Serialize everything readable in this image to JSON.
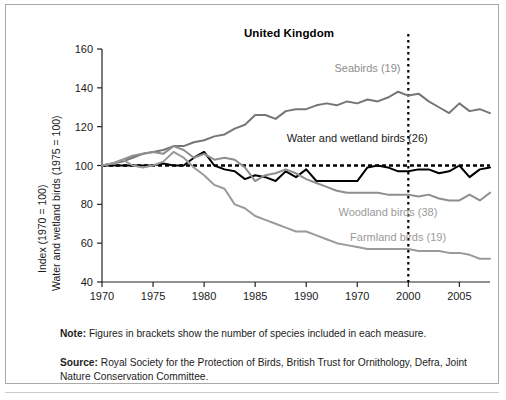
{
  "chart_data": {
    "type": "line",
    "title": "United Kingdom",
    "xlabel": "",
    "ylabel": "Index (1970 = 100)",
    "ylabel2": "Water and wetland birds (1975 = 100)",
    "xlim": [
      1970,
      2008
    ],
    "ylim": [
      40,
      160
    ],
    "yticks": [
      40,
      60,
      80,
      100,
      120,
      140,
      160
    ],
    "xticks": [
      1970,
      1975,
      1980,
      1985,
      1990,
      1970,
      2000,
      2005
    ],
    "xtick_positions": [
      1970,
      1975,
      1980,
      1985,
      1990,
      1995,
      2000,
      2005
    ],
    "grid": false,
    "legend_position": "inline-annotations",
    "baseline": {
      "value": 100,
      "style": "dotted",
      "color": "#000000"
    },
    "marker_line": {
      "value": 2000,
      "style": "dotted",
      "color": "#000000",
      "label": "United Kingdom"
    },
    "x": [
      1970,
      1971,
      1972,
      1973,
      1974,
      1975,
      1976,
      1977,
      1978,
      1979,
      1980,
      1981,
      1982,
      1983,
      1984,
      1985,
      1986,
      1987,
      1988,
      1989,
      1990,
      1991,
      1992,
      1993,
      1994,
      1995,
      1996,
      1997,
      1998,
      1999,
      2000,
      2001,
      2002,
      2003,
      2004,
      2005,
      2006,
      2007,
      2008
    ],
    "series": [
      {
        "name": "Seabirds",
        "species": 19,
        "label": "Seabirds (19)",
        "color": "#767676",
        "width": 2.0,
        "values": [
          100,
          101,
          102,
          104,
          106,
          107,
          108,
          110,
          110,
          112,
          113,
          115,
          116,
          119,
          121,
          126,
          126,
          124,
          128,
          129,
          129,
          131,
          132,
          131,
          133,
          132,
          134,
          133,
          135,
          138,
          136,
          137,
          133,
          130,
          127,
          132,
          128,
          129,
          127
        ]
      },
      {
        "name": "Water and wetland birds",
        "species": 26,
        "label": "Water and wetland birds (26)",
        "color": "#000000",
        "width": 2.0,
        "values": [
          100,
          100,
          100,
          100,
          100,
          100,
          101,
          100,
          100,
          104,
          107,
          100,
          98,
          97,
          93,
          95,
          94,
          92,
          97,
          94,
          98,
          92,
          92,
          92,
          92,
          92,
          99,
          100,
          99,
          97,
          97,
          98,
          98,
          96,
          97,
          100,
          94,
          98,
          99
        ]
      },
      {
        "name": "Woodland birds",
        "species": 38,
        "label": "Woodland birds (38)",
        "color": "#8e8e8e",
        "width": 2.0,
        "values": [
          100,
          101,
          103,
          105,
          106,
          107,
          106,
          110,
          108,
          104,
          106,
          103,
          104,
          103,
          99,
          92,
          95,
          96,
          98,
          96,
          93,
          91,
          89,
          87,
          86,
          86,
          86,
          86,
          85,
          85,
          85,
          84,
          85,
          83,
          82,
          82,
          85,
          82,
          86
        ]
      },
      {
        "name": "Farmland birds",
        "species": 19,
        "label": "Farmland birds (19)",
        "color": "#9a9a9a",
        "width": 2.0,
        "values": [
          100,
          101,
          103,
          100,
          99,
          100,
          102,
          107,
          104,
          99,
          95,
          90,
          88,
          80,
          78,
          74,
          72,
          70,
          68,
          66,
          66,
          64,
          62,
          60,
          59,
          58,
          57,
          57,
          57,
          57,
          57,
          56,
          56,
          56,
          55,
          55,
          54,
          52,
          52
        ]
      }
    ],
    "annotations": [
      {
        "text": "Seabirds (19)",
        "series": "Seabirds",
        "x": 1996,
        "y": 148,
        "color": "#8e8e8e",
        "align": "center"
      },
      {
        "text": "Water and wetland birds (26)",
        "series": "Water and wetland birds",
        "x": 1995,
        "y": 112,
        "color": "#1a1a1a",
        "align": "center"
      },
      {
        "text": "Woodland birds (38)",
        "series": "Woodland birds",
        "x": 1998,
        "y": 74,
        "color": "#9a9a9a",
        "align": "center"
      },
      {
        "text": "Farmland birds (19)",
        "series": "Farmland birds",
        "x": 1999,
        "y": 61,
        "color": "#9a9a9a",
        "align": "center"
      }
    ]
  },
  "notes": {
    "note_lead": "Note:",
    "note_text": "Figures in brackets show the number of species included in each measure.",
    "source_lead": "Source:",
    "source_text": "Royal Society for the Protection of Birds, British Trust for Ornithology, Defra, Joint Nature Conservation Committee."
  }
}
